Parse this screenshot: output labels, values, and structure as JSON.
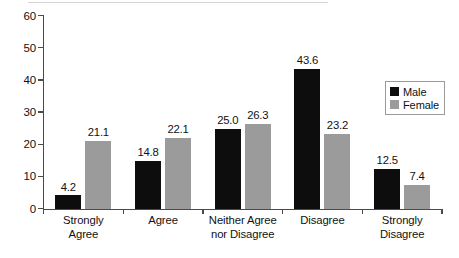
{
  "chart_data": {
    "type": "bar",
    "title": "",
    "subtitle": "",
    "xlabel": "",
    "ylabel": "",
    "ylim": [
      0,
      60
    ],
    "yticks": [
      0,
      10,
      20,
      30,
      40,
      50,
      60
    ],
    "grid": false,
    "legend_position": "top-right",
    "categories": [
      "Strongly Agree",
      "Agree",
      "Neither Agree nor Disagree",
      "Disagree",
      "Strongly Disagree"
    ],
    "category_lines": [
      [
        "Strongly",
        "Agree"
      ],
      [
        "Agree"
      ],
      [
        "Neither Agree",
        "nor Disagree"
      ],
      [
        "Disagree"
      ],
      [
        "Strongly",
        "Disagree"
      ]
    ],
    "series": [
      {
        "name": "Male",
        "color": "#0d0d0d",
        "values": [
          4.2,
          14.8,
          25.0,
          43.6,
          12.5
        ],
        "labels": [
          "4.2",
          "14.8",
          "25.0",
          "43.6",
          "12.5"
        ]
      },
      {
        "name": "Female",
        "color": "#9b9b9b",
        "values": [
          21.1,
          22.1,
          26.3,
          23.2,
          7.4
        ],
        "labels": [
          "21.1",
          "22.1",
          "26.3",
          "23.2",
          "7.4"
        ]
      }
    ]
  },
  "axis": {
    "y_tick_labels": [
      "0",
      "10",
      "20",
      "30",
      "40",
      "50",
      "60"
    ]
  },
  "legend": {
    "entries": [
      {
        "label": "Male",
        "color": "#0d0d0d"
      },
      {
        "label": "Female",
        "color": "#9b9b9b"
      }
    ]
  }
}
